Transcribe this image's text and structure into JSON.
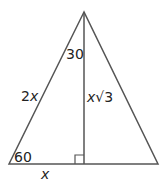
{
  "diagram": {
    "type": "30-60-90 triangle in isosceles triangle",
    "colors": {
      "line": "#555555",
      "text": "#222222",
      "background": "#ffffff"
    },
    "labels": {
      "top_angle": "30",
      "bottom_angle": "60",
      "hypotenuse_var": "2",
      "hypotenuse_x": "x",
      "altitude_x": "x",
      "altitude_root": "√3",
      "base": "x"
    }
  }
}
